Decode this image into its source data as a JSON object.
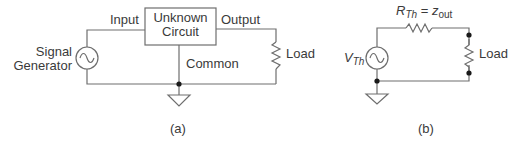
{
  "diagram_a": {
    "caption": "(a)",
    "source_label_line1": "Signal",
    "source_label_line2": "Generator",
    "input_label": "Input",
    "box_line1": "Unknown",
    "box_line2": "Circuit",
    "output_label": "Output",
    "common_label": "Common",
    "load_label": "Load"
  },
  "diagram_b": {
    "caption": "(b)",
    "source_symbol": "V",
    "source_subscript": "Th",
    "resistor_symbol": "R",
    "resistor_subscript": "Th",
    "equals": "=",
    "impedance_symbol": "z",
    "impedance_subscript": "out",
    "load_label": "Load"
  },
  "colors": {
    "line": "#6e6e6e",
    "text": "#3a3a3a",
    "dot": "#1a1a1a"
  }
}
